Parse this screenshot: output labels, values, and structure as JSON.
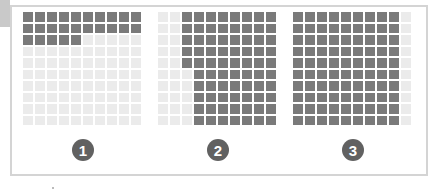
{
  "colors": {
    "filled": "#7a7a7a",
    "empty": "#ebebeb",
    "badge": "#616161",
    "frame": "#d4d4d4"
  },
  "grids": [
    {
      "label": "1",
      "rows": 10,
      "cols": 10,
      "filled_count": 25,
      "fill_pattern": "row-major from top-left: rows 1-2 full, row 3 first 5 cells"
    },
    {
      "label": "2",
      "rows": 10,
      "cols": 10,
      "filled_count": 75,
      "fill_pattern": "columns 3-10 full (70) plus column 3 rows 1-5 (5); columns 1-2 empty"
    },
    {
      "label": "3",
      "rows": 10,
      "cols": 10,
      "filled_count": 90,
      "fill_pattern": "columns 1-9 full, column 10 empty"
    }
  ],
  "chart_data": {
    "type": "table",
    "title": "",
    "categories": [
      "1",
      "2",
      "3"
    ],
    "values": [
      25,
      75,
      90
    ],
    "unit": "filled squares out of 100"
  }
}
